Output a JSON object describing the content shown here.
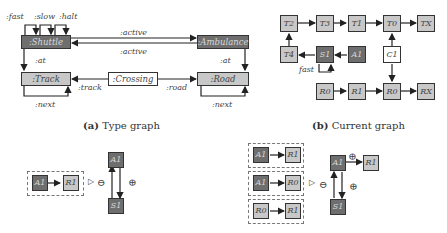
{
  "type_graph": {
    "caption_tag": "(a)",
    "caption_text": "Type graph",
    "nodes": {
      "shuttle": ":Shuttle",
      "ambulance": ":Ambulance",
      "track": ":Track",
      "crossing": ":Crossing",
      "road": ":Road"
    },
    "edge_labels": {
      "fast": ":fast",
      "slow": ":slow",
      "halt": ":halt",
      "active_top": ":active",
      "active_bottom": ":active",
      "at_left": ":at",
      "at_right": ":at",
      "track": ":track",
      "road": ":road",
      "next_left": ":next",
      "next_right": ":next"
    }
  },
  "current_graph": {
    "caption_tag": "(b)",
    "caption_text": "Current graph",
    "nodes": {
      "t2": "T2",
      "t3": "T3",
      "t1": "T1",
      "t0": "T0",
      "tx": "TX",
      "t4": "T4",
      "s1": "S1",
      "a1": "A1",
      "c1": "C1",
      "r0a": "R0",
      "r1": "R1",
      "r0b": "R0",
      "rx": "RX"
    },
    "edge_labels": {
      "fast": "fast"
    }
  },
  "rule_left": {
    "nac": {
      "a1": "A1",
      "r1": "R1"
    },
    "rhs": {
      "a1": "A1",
      "s1": "S1"
    },
    "symbols": {
      "apply": "▷",
      "minus": "⊖",
      "plus": "⊕"
    }
  },
  "rule_right": {
    "nacs": [
      {
        "src": "A1",
        "dst": "R1",
        "src_style": "dark"
      },
      {
        "src": "A1",
        "dst": "R0",
        "src_style": "dark"
      },
      {
        "src": "R0",
        "dst": "R1",
        "src_style": "light"
      }
    ],
    "rhs": {
      "a1": "A1",
      "s1": "S1",
      "r1": "R1"
    },
    "symbols": {
      "apply": "▷",
      "minus": "⊖",
      "plus_edge": "⊕",
      "plus_loop": "⊕"
    }
  }
}
